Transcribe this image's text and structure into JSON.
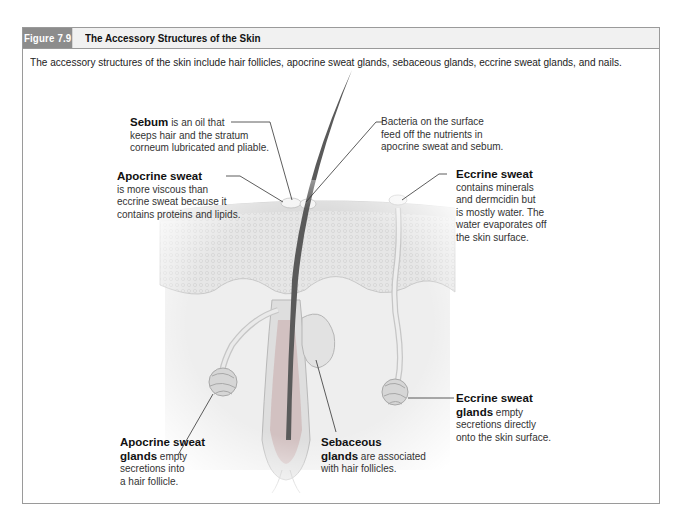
{
  "figure": {
    "number": "Figure 7.9",
    "title": "The Accessory Structures of the Skin",
    "caption": "The accessory structures of the skin include hair follicles, apocrine sweat glands, sebaceous glands, eccrine sweat glands, and nails."
  },
  "labels": {
    "sebum": {
      "term": "Sebum",
      "lines": [
        "is an oil that",
        "keeps hair and the stratum",
        "corneum lubricated and pliable."
      ]
    },
    "bacteria": {
      "lines": [
        "Bacteria on the surface",
        "feed off the nutrients in",
        "apocrine sweat and sebum."
      ]
    },
    "apocrine_sweat": {
      "term": "Apocrine sweat",
      "lines": [
        "is more viscous than",
        "eccrine sweat because it",
        "contains proteins and lipids."
      ]
    },
    "eccrine_sweat": {
      "term": "Eccrine sweat",
      "lines": [
        "contains minerals",
        "and dermcidin but",
        "is mostly water. The",
        "water evaporates off",
        "the skin surface."
      ]
    },
    "apocrine_glands": {
      "term1": "Apocrine sweat",
      "term2": "glands",
      "lines": [
        "empty",
        "secretions into",
        "a hair follicle."
      ]
    },
    "sebaceous_glands": {
      "term1": "Sebaceous",
      "term2": "glands",
      "lines": [
        "are associated",
        "with hair follicles."
      ]
    },
    "eccrine_glands": {
      "term1": "Eccrine sweat",
      "term2": "glands",
      "lines": [
        "empty",
        "secretions directly",
        "onto the skin surface."
      ]
    }
  },
  "colors": {
    "frame_border": "#9a9a9a",
    "figure_tab": "#8c8c8c",
    "header_bg": "#f1f1f1",
    "hair": "#5a5a5a",
    "epidermis": "#e4e4e4",
    "dermis": "#ececec",
    "gland": "#d6d6d6"
  }
}
